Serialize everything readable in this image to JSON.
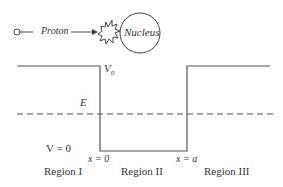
{
  "top": {
    "particle_label": "Proton",
    "target_label": "Nucleus"
  },
  "diagram": {
    "barrier_label": "V",
    "barrier_subscript": "0",
    "energy_label": "E",
    "zero_potential_label": "V = 0",
    "x0_label": "x = 0",
    "xa_label": "x = a",
    "regions": [
      "Region I",
      "Region II",
      "Region III"
    ]
  },
  "colors": {
    "line": "#555555",
    "text": "#333333"
  }
}
